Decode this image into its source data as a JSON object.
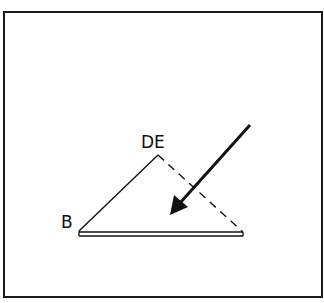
{
  "diagram": {
    "labels": {
      "apex": "DE",
      "left_vertex": "B"
    },
    "colors": {
      "stroke": "#111111",
      "background": "#ffffff"
    },
    "elements": {
      "solid_edge": "B to DE",
      "dashed_edge": "DE to right vertex",
      "base": "double-line base from B to right vertex",
      "arrow": "incoming arrow pointing down-left into triangle"
    }
  }
}
